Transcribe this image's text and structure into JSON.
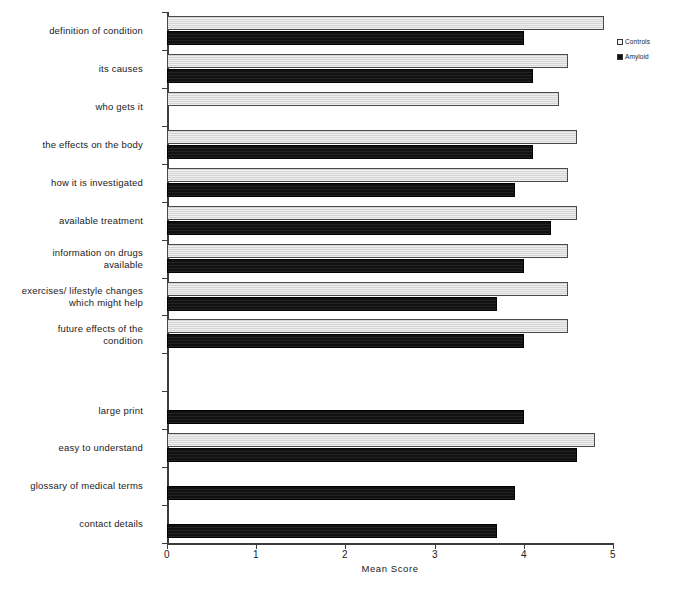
{
  "chart_data": {
    "type": "bar",
    "orientation": "horizontal",
    "title": "",
    "xlabel": "Mean Score",
    "ylabel": "",
    "xlim": [
      0,
      5
    ],
    "xticks": [
      "0",
      "1",
      "2",
      "3",
      "4",
      "5"
    ],
    "grid": false,
    "legend_position": "top-right",
    "categories": [
      "definition of condition",
      "its causes",
      "who gets it",
      "the effects on the body",
      "how it is investigated",
      "available treatment",
      "information on drugs\navailable",
      "exercises/ lifestyle changes\nwhich might help",
      "future effects of the\ncondition",
      "",
      "large print",
      "easy to understand",
      "glossary of medical terms",
      "contact details"
    ],
    "series": [
      {
        "name": "Controls",
        "color": "#dcdcdc",
        "values": [
          4.9,
          4.5,
          4.4,
          4.6,
          4.5,
          4.6,
          4.5,
          4.5,
          4.5,
          null,
          null,
          4.8,
          null,
          null
        ]
      },
      {
        "name": "Amyloid",
        "color": "#111111",
        "values": [
          4.0,
          4.1,
          null,
          4.1,
          3.9,
          4.3,
          4.0,
          3.7,
          4.0,
          null,
          4.0,
          4.6,
          3.9,
          3.7
        ]
      }
    ]
  },
  "legend": {
    "items": [
      {
        "label": "Controls",
        "swatch": "controls"
      },
      {
        "label": "Amyloid",
        "swatch": "amyloid"
      }
    ]
  },
  "axis": {
    "x_title": "Mean Score",
    "tick_0": "0",
    "tick_1": "1",
    "tick_2": "2",
    "tick_3": "3",
    "tick_4": "4",
    "tick_5": "5"
  }
}
